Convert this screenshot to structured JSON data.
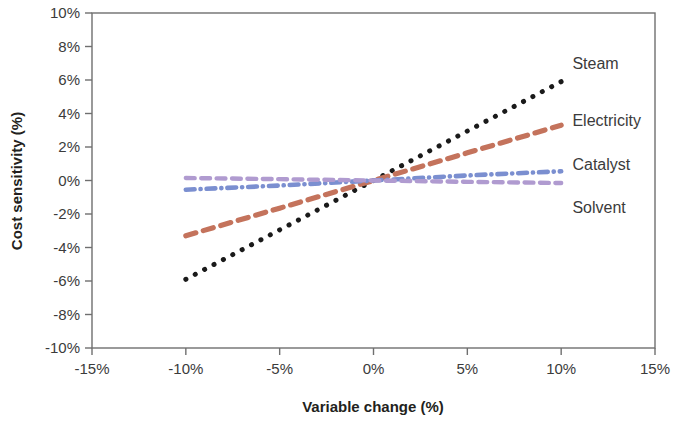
{
  "chart_data": {
    "type": "line",
    "title": "",
    "xlabel": "Variable change (%)",
    "ylabel": "Cost sensitivity (%)",
    "xlim": [
      -15,
      15
    ],
    "ylim": [
      -10,
      10
    ],
    "xticks": [
      -15,
      -10,
      -5,
      0,
      5,
      10,
      15
    ],
    "xtick_labels": [
      "-15%",
      "-10%",
      "-5%",
      "0%",
      "5%",
      "10%",
      "15%"
    ],
    "yticks": [
      -10,
      -8,
      -6,
      -4,
      -2,
      0,
      2,
      4,
      6,
      8,
      10
    ],
    "ytick_labels": [
      "-10%",
      "-8%",
      "-6%",
      "-4%",
      "-2%",
      "0%",
      "2%",
      "4%",
      "6%",
      "8%",
      "10%"
    ],
    "grid": false,
    "legend_position": "inline-right-labels",
    "x": [
      -10,
      -5,
      0,
      5,
      10
    ],
    "series": [
      {
        "name": "Steam",
        "color": "#1a1a1a",
        "style": "dotted",
        "values": [
          -5.9,
          -2.95,
          0.0,
          2.95,
          5.9
        ],
        "label_x": 10.6,
        "label_y": 7.0
      },
      {
        "name": "Electricity",
        "color": "#c4735c",
        "style": "dashed",
        "values": [
          -3.3,
          -1.65,
          0.0,
          1.65,
          3.3
        ],
        "label_x": 10.6,
        "label_y": 3.6
      },
      {
        "name": "Catalyst",
        "color": "#7b8fd0",
        "style": "dash-dot",
        "values": [
          -0.55,
          -0.3,
          0.0,
          0.3,
          0.55
        ],
        "label_x": 10.6,
        "label_y": 1.0
      },
      {
        "name": "Solvent",
        "color": "#b09bd0",
        "style": "dashed",
        "values": [
          0.15,
          0.08,
          0.0,
          -0.08,
          -0.15
        ],
        "label_x": 10.6,
        "label_y": -1.6
      }
    ]
  },
  "axes": {
    "x_title": "Variable change (%)",
    "y_title": "Cost sensitivity (%)"
  }
}
